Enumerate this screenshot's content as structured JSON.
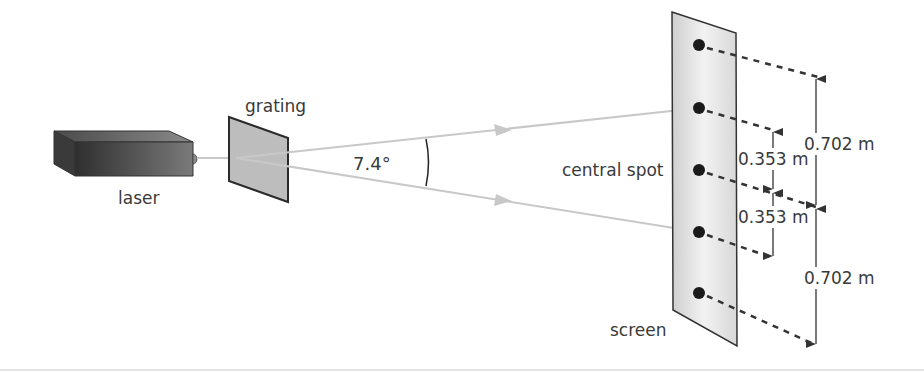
{
  "diagram": {
    "labels": {
      "laser": "laser",
      "grating": "grating",
      "angle": "7.4°",
      "central_spot": "central spot",
      "screen": "screen"
    },
    "dimensions": {
      "upper_outer": "0.702 m",
      "upper_inner": "0.353 m",
      "lower_inner": "0.353 m",
      "lower_outer": "0.702 m"
    },
    "spots": [
      {
        "order": "+2",
        "y": 45
      },
      {
        "order": "+1",
        "y": 108
      },
      {
        "order": "0",
        "y": 170
      },
      {
        "order": "-1",
        "y": 232
      },
      {
        "order": "-2",
        "y": 293
      }
    ],
    "colors": {
      "beam": "#c8c8c8",
      "laser_dark": "#3c3c3c",
      "grating_fill": "#bdbdbd",
      "screen_fill": "#e6e6e6",
      "spot": "#1a1a1a",
      "line": "#333333"
    }
  }
}
